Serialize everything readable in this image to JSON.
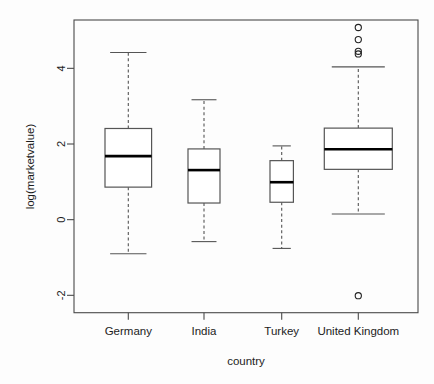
{
  "chart_data": {
    "type": "box",
    "title": "",
    "xlabel": "country",
    "ylabel": "log(marketvalue)",
    "categories": [
      "Germany",
      "India",
      "Turkey",
      "United Kingdom"
    ],
    "ytick_labels": [
      "-2",
      "0",
      "2",
      "4"
    ],
    "ytick_values": [
      -2,
      0,
      2,
      4
    ],
    "ylim": [
      -2.55,
      5.35
    ],
    "grid": false,
    "legend": "none",
    "box_fill": "#ffffff",
    "box_stroke": "#555555",
    "median_stroke": "#000000",
    "whisker_style": "dashed",
    "boxes": [
      {
        "category": "Germany",
        "lower_whisker": -0.9,
        "q1": 0.86,
        "median": 1.68,
        "q3": 2.41,
        "upper_whisker": 4.42,
        "outliers": []
      },
      {
        "category": "India",
        "lower_whisker": -0.58,
        "q1": 0.44,
        "median": 1.31,
        "q3": 1.87,
        "upper_whisker": 3.17,
        "outliers": []
      },
      {
        "category": "Turkey",
        "lower_whisker": -0.76,
        "q1": 0.46,
        "median": 0.99,
        "q3": 1.56,
        "upper_whisker": 1.95,
        "outliers": []
      },
      {
        "category": "United Kingdom",
        "lower_whisker": 0.15,
        "q1": 1.33,
        "median": 1.86,
        "q3": 2.42,
        "upper_whisker": 4.04,
        "outliers": [
          5.08,
          4.76,
          4.45,
          4.38,
          -2.01
        ]
      }
    ]
  },
  "axes": {
    "y_axis_title": "log(marketvalue)",
    "x_axis_title": "country"
  }
}
